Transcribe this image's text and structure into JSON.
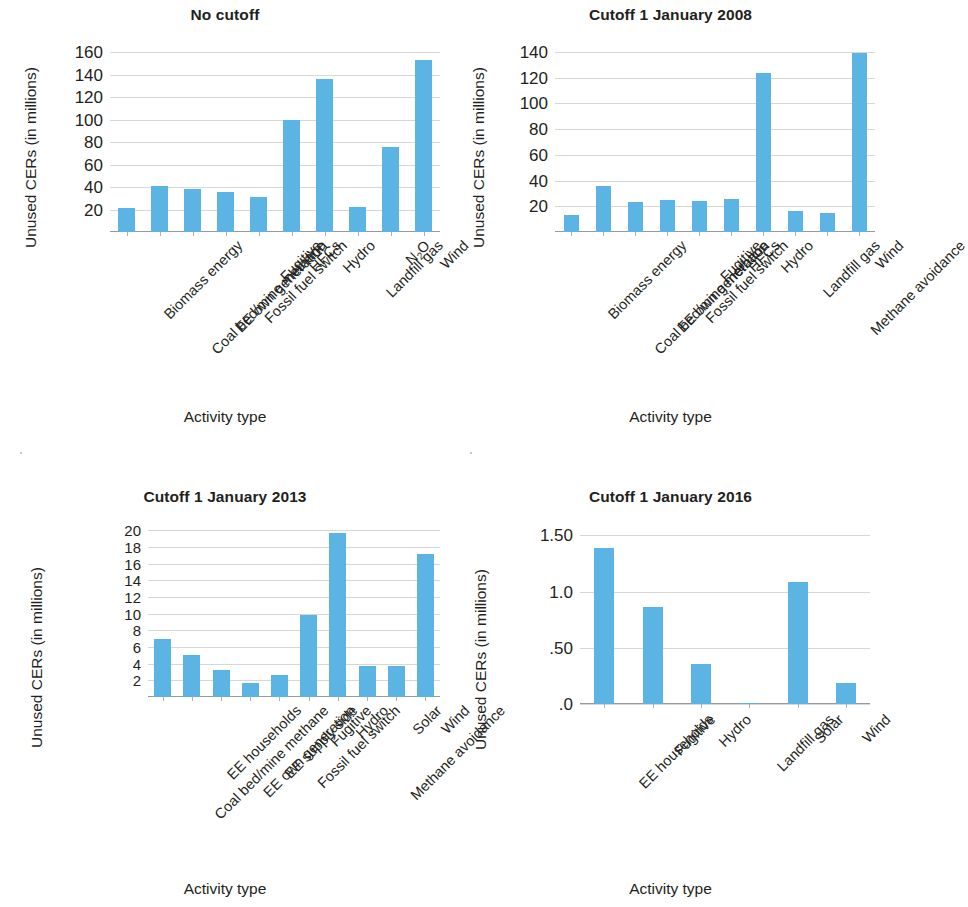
{
  "figure": {
    "panel_count": 4,
    "bar_color": "#5cb4e4",
    "gridline_color": "#c9c9c9",
    "text_color": "#231f20"
  },
  "panels": [
    {
      "key": "no_cutoff",
      "title": "No cutoff",
      "ylabel": "Unused CERs (in millions)",
      "xlabel": "Activity type"
    },
    {
      "key": "cutoff_2008",
      "title": "Cutoff 1 January 2008",
      "ylabel": "Unused CERs (in millions)",
      "xlabel": "Activity type"
    },
    {
      "key": "cutoff_2013",
      "title": "Cutoff 1 January 2013",
      "ylabel": "Unused CERs (in millions)",
      "xlabel": "Activity type"
    },
    {
      "key": "cutoff_2016",
      "title": "Cutoff 1 January 2016",
      "ylabel": "Unused CERs (in millions)",
      "xlabel": "Activity type"
    }
  ],
  "chart_data": [
    {
      "type": "bar",
      "title": "No cutoff",
      "xlabel": "Activity type",
      "ylabel": "Unused CERs (in millions)",
      "categories": [
        "Biomass energy",
        "Coal bed/mine methane",
        "EE own generation",
        "Fossil fuel switch",
        "Fugitive",
        "HFCs",
        "Hydro",
        "Landfill gas",
        "N2O",
        "Wind"
      ],
      "values": [
        21,
        41,
        38,
        36,
        31,
        100,
        136,
        22,
        76,
        153
      ],
      "ylim": [
        0,
        160
      ],
      "yticks": [
        20,
        40,
        60,
        80,
        100,
        120,
        140,
        160
      ],
      "ytick_labels": [
        "20",
        "40",
        "60",
        "80",
        "100",
        "120",
        "140",
        "160"
      ],
      "grid": true,
      "legend": false
    },
    {
      "type": "bar",
      "title": "Cutoff 1 January 2008",
      "xlabel": "Activity type",
      "ylabel": "Unused CERs (in millions)",
      "categories": [
        "Biomass energy",
        "Coal bed/mine methane",
        "EE own generation",
        "Fossil fuel switch",
        "Fugitive",
        "HFCs",
        "Hydro",
        "Landfill gas",
        "Methane avoidance",
        "Wind"
      ],
      "values": [
        13,
        36,
        23,
        25,
        24,
        26,
        124,
        16,
        15,
        139
      ],
      "ylim": [
        0,
        140
      ],
      "yticks": [
        20,
        40,
        60,
        80,
        100,
        120,
        140
      ],
      "ytick_labels": [
        "20",
        "40",
        "60",
        "80",
        "100",
        "120",
        "140"
      ],
      "grid": true,
      "legend": false
    },
    {
      "type": "bar",
      "title": "Cutoff 1 January 2013",
      "xlabel": "Activity type",
      "ylabel": "Unused CERs (in millions)",
      "categories": [
        "Coal bed/mine methane",
        "EE households",
        "EE own generation",
        "EE supply side",
        "Fossil fuel switch",
        "Fugitive",
        "Hydro",
        "Methane avoidance",
        "Solar",
        "Wind"
      ],
      "values": [
        7.0,
        5.0,
        3.2,
        1.7,
        2.6,
        9.8,
        19.7,
        3.7,
        3.7,
        17.2
      ],
      "ylim": [
        0,
        21
      ],
      "yticks": [
        2,
        4,
        6,
        8,
        10,
        12,
        14,
        16,
        18,
        20
      ],
      "ytick_labels": [
        "2",
        "4",
        "6",
        "8",
        "10",
        "12",
        "14",
        "16",
        "18",
        "20"
      ],
      "grid": true,
      "legend": false
    },
    {
      "type": "bar",
      "title": "Cutoff 1 January 2016",
      "xlabel": "Activity type",
      "ylabel": "Unused CERs (in millions)",
      "categories": [
        "EE households",
        "Fugitive",
        "Hydro",
        "Landfill gas",
        "Solar",
        "Wind"
      ],
      "values": [
        1.39,
        0.86,
        0.36,
        0.01,
        1.09,
        0.19
      ],
      "ylim": [
        0,
        1.62
      ],
      "yticks": [
        0,
        0.5,
        1.0,
        1.5
      ],
      "ytick_labels": [
        ".0",
        ".50",
        "1.0",
        "1.50"
      ],
      "grid": true,
      "legend": false
    }
  ]
}
